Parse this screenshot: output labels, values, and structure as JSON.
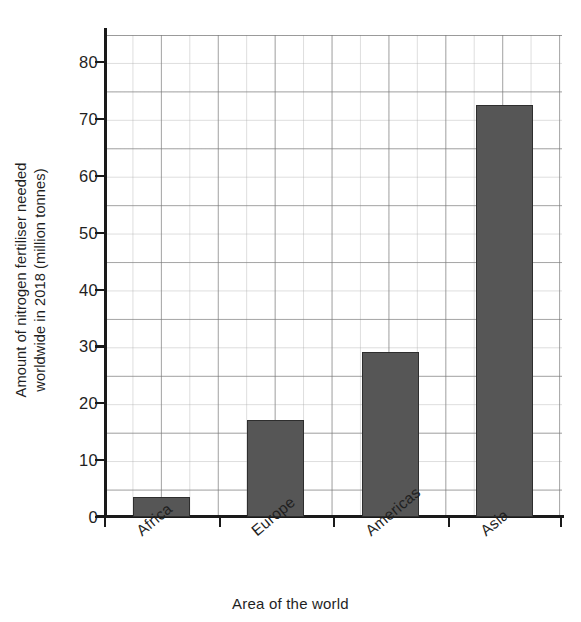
{
  "chart_data": {
    "type": "bar",
    "title": "",
    "categories": [
      "Africa",
      "Europe",
      "Americas",
      "Asia"
    ],
    "values": [
      3.5,
      17,
      29,
      72.5
    ],
    "xlabel": "Area of the world",
    "ylabel": "Amount of nitrogen fertiliser needed worldwide in 2018 (million tonnes)",
    "ylabel_line1": "Amount of nitrogen fertiliser needed",
    "ylabel_line2": "worldwide in 2018 (million tonnes)",
    "ylim": [
      0,
      85
    ],
    "ytick_labels": [
      "0",
      "10",
      "20",
      "30",
      "40",
      "50",
      "60",
      "70",
      "80"
    ],
    "ytick_values": [
      0,
      10,
      20,
      30,
      40,
      50,
      60,
      70,
      80
    ],
    "minor_tick_step": 2,
    "grid": true,
    "legend": "none",
    "bar_color": "#565656",
    "bar_edge_color": "#2e2e2e",
    "grid_color": "#9a9a9a",
    "axis_color": "#1a1a1a"
  }
}
